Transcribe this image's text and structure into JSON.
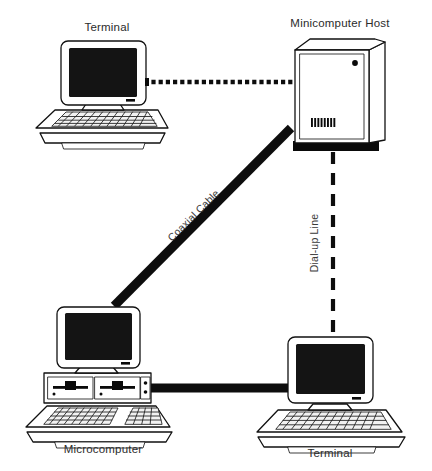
{
  "diagram": {
    "canvas": {
      "width": 432,
      "height": 471,
      "background": "#ffffff"
    },
    "ink_color": "#111111",
    "screen_color": "#141414",
    "nodes": [
      {
        "id": "terminal-top",
        "label": "Terminal",
        "type": "terminal",
        "label_position": "above",
        "label_x": 107,
        "label_y": 31
      },
      {
        "id": "minicomputer-host",
        "label": "Minicomputer Host",
        "type": "minicomputer-cabinet",
        "label_position": "above",
        "label_x": 340,
        "label_y": 27
      },
      {
        "id": "microcomputer",
        "label": "Microcomputer",
        "type": "microcomputer",
        "label_position": "below",
        "label_x": 103,
        "label_y": 453
      },
      {
        "id": "terminal-bottom",
        "label": "Terminal",
        "type": "terminal",
        "label_position": "below",
        "label_x": 330,
        "label_y": 457
      }
    ],
    "links": [
      {
        "id": "link-terminal-host",
        "label": "",
        "style": "dotted",
        "from": "terminal-top",
        "to": "minicomputer-host"
      },
      {
        "id": "link-coaxial",
        "label": "Coaxial Cable",
        "style": "thick-solid",
        "from": "minicomputer-host",
        "to": "microcomputer",
        "label_x": 196,
        "label_y": 218,
        "label_rotation": -45
      },
      {
        "id": "link-dialup",
        "label": "Dial-up Line",
        "style": "dashed",
        "from": "minicomputer-host",
        "to": "terminal-bottom",
        "label_x": 318,
        "label_y": 243,
        "label_rotation": -90
      },
      {
        "id": "link-micro-terminal",
        "label": "",
        "style": "thick-solid",
        "from": "microcomputer",
        "to": "terminal-bottom"
      }
    ]
  }
}
